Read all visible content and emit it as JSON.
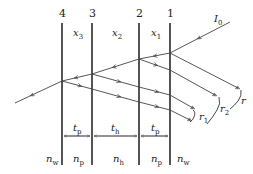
{
  "diagram": {
    "boundaries": [
      {
        "id": "4",
        "label": "4",
        "x": 62
      },
      {
        "id": "3",
        "label": "3",
        "x": 92
      },
      {
        "id": "2",
        "label": "2",
        "x": 139
      },
      {
        "id": "1",
        "label": "1",
        "x": 170
      }
    ],
    "regions_top": [
      {
        "label": "x",
        "sub": "3"
      },
      {
        "label": "x",
        "sub": "2"
      },
      {
        "label": "x",
        "sub": "1"
      }
    ],
    "incident": {
      "label": "I",
      "sub": "0"
    },
    "reflections": [
      {
        "label": "r",
        "sub": ""
      },
      {
        "label": "r",
        "sub": "2"
      },
      {
        "label": "r",
        "sub": "1"
      }
    ],
    "thicknesses": [
      {
        "label": "t",
        "sub": "p"
      },
      {
        "label": "t",
        "sub": "h"
      },
      {
        "label": "t",
        "sub": "p"
      }
    ],
    "indices": [
      {
        "label": "n",
        "sub": "w"
      },
      {
        "label": "n",
        "sub": "p"
      },
      {
        "label": "n",
        "sub": "h"
      },
      {
        "label": "n",
        "sub": "p"
      },
      {
        "label": "n",
        "sub": "w"
      }
    ]
  }
}
